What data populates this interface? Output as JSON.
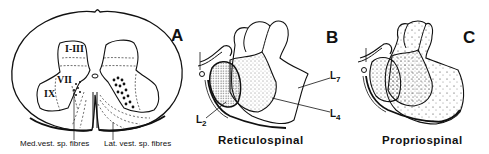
{
  "figure": {
    "panels": [
      {
        "letter": "A",
        "laminae": [
          "I-III",
          "VII",
          "IX"
        ],
        "captions": {
          "medial": "Med.vest. sp. fibres",
          "lateral": "Lat. vest. sp. fibres"
        }
      },
      {
        "letter": "B",
        "title": "Reticulospinal",
        "levels": {
          "l2": "L",
          "l2_sub": "2",
          "l4": "L",
          "l4_sub": "4",
          "l7": "L",
          "l7_sub": "7"
        }
      },
      {
        "letter": "C",
        "title": "Propriospinal"
      }
    ],
    "colors": {
      "ink": "#111111",
      "background": "#ffffff"
    }
  }
}
